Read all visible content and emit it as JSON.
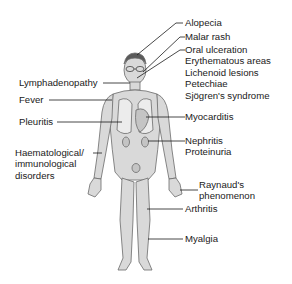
{
  "diagram": {
    "labels_left": [
      {
        "id": "lymphadenopathy",
        "text": "Lymphadenopathy"
      },
      {
        "id": "fever",
        "text": "Fever"
      },
      {
        "id": "pleuritis",
        "text": "Pleuritis"
      },
      {
        "id": "haematological",
        "lines": [
          "Haematological/",
          "immunological",
          "disorders"
        ]
      }
    ],
    "labels_right": [
      {
        "id": "alopecia",
        "text": "Alopecia"
      },
      {
        "id": "malar-rash",
        "text": "Malar rash"
      },
      {
        "id": "oral-group",
        "lines": [
          "Oral ulceration",
          "Erythematous areas",
          "Lichenoid lesions",
          "Petechiae",
          "Sjögren's syndrome"
        ]
      },
      {
        "id": "myocarditis",
        "text": "Myocarditis"
      },
      {
        "id": "nephritis-group",
        "lines": [
          "Nephritis",
          "Proteinuria"
        ]
      },
      {
        "id": "raynauds",
        "lines": [
          "Raynaud's",
          "phenomenon"
        ]
      },
      {
        "id": "arthritis",
        "text": "Arthritis"
      },
      {
        "id": "myalgia",
        "text": "Myalgia"
      }
    ],
    "colors": {
      "body_fill": "#d9d9d9",
      "body_stroke": "#6b6b6b",
      "organ_fill": "#c4c4c4",
      "leader_line": "#1a1a1a",
      "text": "#1a1a1a"
    }
  }
}
